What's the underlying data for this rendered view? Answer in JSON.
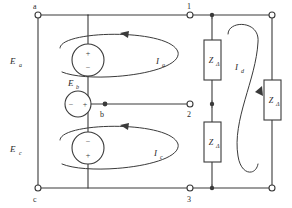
{
  "diagram": {
    "type": "electrical-circuit-schematic",
    "background_color": "#ffffff",
    "line_color": "#3a3a3a",
    "text_color": "#2b2b2b"
  },
  "nodes": [
    {
      "id": "a",
      "label": "a",
      "x": 38,
      "y": 15,
      "style": "ring"
    },
    {
      "id": "b",
      "label": "b",
      "x": 105,
      "y": 104,
      "style": "dot"
    },
    {
      "id": "c",
      "label": "c",
      "x": 38,
      "y": 188,
      "style": "ring"
    },
    {
      "id": "n1",
      "label": "1",
      "x": 190,
      "y": 15,
      "style": "ring"
    },
    {
      "id": "n2",
      "label": "2",
      "x": 190,
      "y": 104,
      "style": "ring"
    },
    {
      "id": "n3",
      "label": "3",
      "x": 190,
      "y": 188,
      "style": "ring"
    },
    {
      "id": "r1",
      "label": "",
      "x": 272,
      "y": 15,
      "style": "ring"
    },
    {
      "id": "r3",
      "label": "",
      "x": 272,
      "y": 188,
      "style": "ring"
    }
  ],
  "sources": [
    {
      "id": "Ea",
      "label": "E",
      "subscript": "a",
      "orientation": "vertical",
      "cx": 88,
      "cy": 60,
      "r": 16,
      "top_polarity": "+",
      "bottom_polarity": "−",
      "label_x": 14,
      "label_y": 62
    },
    {
      "id": "Eb",
      "label": "E",
      "subscript": "b",
      "orientation": "horizontal",
      "cx": 78,
      "cy": 104,
      "r": 13,
      "left_polarity": "−",
      "right_polarity": "+",
      "label_x": 70,
      "label_y": 84
    },
    {
      "id": "Ec",
      "label": "E",
      "subscript": "c",
      "orientation": "vertical",
      "cx": 88,
      "cy": 148,
      "r": 16,
      "top_polarity": "−",
      "bottom_polarity": "+",
      "label_x": 14,
      "label_y": 150
    }
  ],
  "impedances": [
    {
      "id": "Z1",
      "label": "Z",
      "subscript": "Δ",
      "x": 204,
      "y": 40,
      "w": 17,
      "h": 40,
      "orientation": "vertical"
    },
    {
      "id": "Z2",
      "label": "Z",
      "subscript": "Δ",
      "x": 204,
      "y": 122,
      "w": 17,
      "h": 40,
      "orientation": "vertical"
    },
    {
      "id": "Z3",
      "label": "Z",
      "subscript": "Δ",
      "x": 264,
      "y": 80,
      "w": 17,
      "h": 40,
      "orientation": "vertical"
    }
  ],
  "mesh_currents": [
    {
      "id": "Ia",
      "label": "I",
      "subscript": "a",
      "label_x": 160,
      "label_y": 62,
      "direction": "counterclockwise"
    },
    {
      "id": "Ic",
      "label": "I",
      "subscript": "c",
      "label_x": 158,
      "label_y": 154,
      "direction": "counterclockwise"
    },
    {
      "id": "Id",
      "label": "I",
      "subscript": "d",
      "label_x": 239,
      "label_y": 68,
      "direction": "clockwise"
    }
  ],
  "wires_description": [
    "node a to node 1 along top rail",
    "node a down through source Ea to node b",
    "node b through source Eb to node 2",
    "node b down through source Ec to node c",
    "node c to node 3 along bottom rail",
    "node 1 down through impedance Z-delta to node 2",
    "node 2 down through impedance Z-delta to node 3",
    "node 1 right to top-right corner",
    "node 3 right to bottom-right corner",
    "right vertical branch through impedance Z-delta"
  ]
}
